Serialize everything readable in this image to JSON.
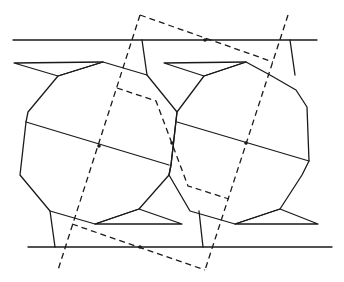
{
  "diagram": {
    "type": "geometric-tiling",
    "colors": {
      "stroke": "#1a1a1a",
      "background": "#ffffff"
    },
    "horizontal_lines": [
      {
        "name": "top-line",
        "x1": 13,
        "y1": 40,
        "x2": 317,
        "y2": 40
      },
      {
        "name": "bottom-line",
        "x1": 28,
        "y1": 247,
        "x2": 332,
        "y2": 247
      }
    ],
    "polygons": [
      {
        "name": "left-polygon",
        "points": "58,76 28,112 26,122 20,175 50,211 95,224 139,209 169,175 171,165 177,112 147,75 103,62"
      },
      {
        "name": "right-polygon",
        "points": "204,76 177,112 171,165 169,175 190,211 235,224 280,209 302,175 309,161 307,107 296,90 270,75 246,62"
      }
    ],
    "triangles": [
      {
        "name": "top-left-spike",
        "points": "14,63 103,62 58,76"
      },
      {
        "name": "top-right-spike",
        "points": "164,63 246,62 204,76"
      },
      {
        "name": "bottom-left-spike",
        "points": "95,224 182,224 139,209"
      },
      {
        "name": "bottom-right-spike",
        "points": "235,224 318,224 280,209"
      }
    ],
    "connectors": [
      {
        "name": "top-left-connector",
        "points": "142,40 147,75"
      },
      {
        "name": "top-right-connector",
        "points": "290,40 295,75"
      },
      {
        "name": "bottom-left-connector",
        "points": "50,211 55,247"
      },
      {
        "name": "bottom-right-connector",
        "points": "199,211 203,247"
      }
    ],
    "diagonals": [
      {
        "name": "left-diagonal",
        "x1": 26,
        "y1": 122,
        "x2": 169,
        "y2": 165
      },
      {
        "name": "right-diagonal",
        "x1": 177,
        "y1": 122,
        "x2": 309,
        "y2": 161
      }
    ],
    "dashed_lines": [
      {
        "name": "dashed-left-edge",
        "points": "140,15 58,270"
      },
      {
        "name": "dashed-top-edge",
        "points": "140,15 273,62"
      },
      {
        "name": "dashed-right-edge",
        "points": "288,15 205,270"
      },
      {
        "name": "dashed-bottom-edge",
        "points": "72,224 205,270"
      },
      {
        "name": "dashed-inner-path",
        "points": "117,88 156,101 188,186 229,199"
      }
    ],
    "points": [
      {
        "name": "left-center-dot",
        "cx": 99,
        "cy": 146
      },
      {
        "name": "middle-dot",
        "cx": 172,
        "cy": 143
      },
      {
        "name": "right-center-dot",
        "cx": 246,
        "cy": 143
      },
      {
        "name": "top-dot",
        "cx": 205,
        "cy": 40
      },
      {
        "name": "bottom-dot",
        "cx": 140,
        "cy": 247
      }
    ]
  }
}
